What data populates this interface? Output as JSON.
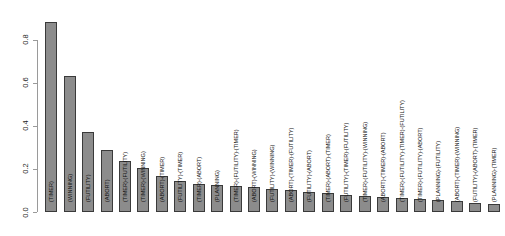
{
  "chart_data": {
    "type": "bar",
    "title": "",
    "subtitle": "",
    "xlabel": "",
    "ylabel": "",
    "ylim": [
      0,
      0.9
    ],
    "grid": false,
    "legend": null,
    "y_ticks": [
      "0.0",
      "0.2",
      "0.4",
      "0.6",
      "0.8"
    ],
    "y_tick_values": [
      0.0,
      0.2,
      0.4,
      0.6,
      0.8
    ],
    "bar_color": "#8c8c8c",
    "bar_border_color": "#3a3a3a",
    "axis_color": "#9a9a9a",
    "categories": [
      "(TIMER)",
      "(WINNING)",
      "(FUTILITY)",
      "(ABORT)",
      "(TIMER)-(FUTILITY)",
      "(TIMER)-(WINNING)",
      "(ABORT)-(TIMER)",
      "(FUTILITY)-(TIMER)",
      "(TIMER)-(ABORT)",
      "(PLANNING)",
      "(TIMER)-(FUTILITY)-(TIMER)",
      "(ABORT)-(WINNING)",
      "(FUTILITY)-(WINNING)",
      "(ABORT)-(TIMER)-(FUTILITY)",
      "(FUTILITY)-(ABORT)",
      "(TIMER)-(ABORT)-(TIMER)",
      "(FUTILITY)-(TIMER)-(FUTILITY)",
      "(TIMER)-(FUTILITY)-(WINNING)",
      "(ABORT)-(TIMER)-(ABORT)",
      "(TIMER)-(FUTILITY)-(TIMER)-(FUTILITY)",
      "(TIMER)-(FUTILITY)-(ABORT)",
      "(PLANNING)-(FUTILITY)",
      "(ABORT)-(TIMER)-(WINNING)",
      "(FUTILITY)-(ABORT)-(TIMER)",
      "(PLANNING)-(TIMER)"
    ],
    "values": [
      0.88,
      0.63,
      0.37,
      0.29,
      0.235,
      0.205,
      0.165,
      0.145,
      0.13,
      0.125,
      0.12,
      0.115,
      0.105,
      0.1,
      0.095,
      0.09,
      0.08,
      0.075,
      0.07,
      0.065,
      0.06,
      0.055,
      0.05,
      0.04,
      0.035
    ]
  }
}
